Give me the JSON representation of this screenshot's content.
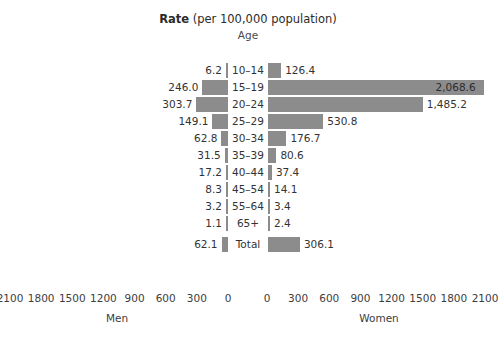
{
  "chart_data": {
    "type": "bar",
    "title": "Rate (per 100,000 population)",
    "title_strong": "Rate",
    "title_normal": " (per 100,000 population)",
    "category_header": "Age",
    "xlabel_left": "Men",
    "xlabel_right": "Women",
    "ylabel": "Age",
    "grid": false,
    "legend_position": "none",
    "axis_left_ticks": [
      2100,
      1800,
      1500,
      1200,
      900,
      600,
      300,
      0
    ],
    "axis_right_ticks": [
      0,
      300,
      600,
      900,
      1200,
      1500,
      1800,
      2100
    ],
    "axis_left_tick_labels": [
      "2100",
      "1800",
      "1500",
      "1200",
      "900",
      "600",
      "300",
      "0"
    ],
    "axis_right_tick_labels": [
      "0",
      "300",
      "600",
      "900",
      "1200",
      "1500",
      "1800",
      "2100"
    ],
    "xlim": [
      0,
      2100
    ],
    "bar_color": "#8c8c8c",
    "categories": [
      "10–14",
      "15–19",
      "20–24",
      "25–29",
      "30–34",
      "35–39",
      "40–44",
      "45–54",
      "55–64",
      "65+",
      "Total"
    ],
    "series": [
      {
        "name": "Men",
        "side": "left",
        "values": [
          6.2,
          246.0,
          303.7,
          149.1,
          62.8,
          31.5,
          17.2,
          8.3,
          3.2,
          1.1,
          62.1
        ],
        "labels": [
          "6.2",
          "246.0",
          "303.7",
          "149.1",
          "62.8",
          "31.5",
          "17.2",
          "8.3",
          "3.2",
          "1.1",
          "62.1"
        ]
      },
      {
        "name": "Women",
        "side": "right",
        "values": [
          126.4,
          2068.6,
          1485.2,
          530.8,
          176.7,
          80.6,
          37.4,
          14.1,
          3.4,
          2.4,
          306.1
        ],
        "labels": [
          "126.4",
          "2,068.6",
          "1,485.2",
          "530.8",
          "176.7",
          "80.6",
          "37.4",
          "14.1",
          "3.4",
          "2.4",
          "306.1"
        ]
      }
    ],
    "rows": [
      {
        "age": "10–14",
        "men": 6.2,
        "men_label": "6.2",
        "women": 126.4,
        "women_label": "126.4"
      },
      {
        "age": "15–19",
        "men": 246.0,
        "men_label": "246.0",
        "women": 2068.6,
        "women_label": "2,068.6"
      },
      {
        "age": "20–24",
        "men": 303.7,
        "men_label": "303.7",
        "women": 1485.2,
        "women_label": "1,485.2"
      },
      {
        "age": "25–29",
        "men": 149.1,
        "men_label": "149.1",
        "women": 530.8,
        "women_label": "530.8"
      },
      {
        "age": "30–34",
        "men": 62.8,
        "men_label": "62.8",
        "women": 176.7,
        "women_label": "176.7"
      },
      {
        "age": "35–39",
        "men": 31.5,
        "men_label": "31.5",
        "women": 80.6,
        "women_label": "80.6"
      },
      {
        "age": "40–44",
        "men": 17.2,
        "men_label": "17.2",
        "women": 37.4,
        "women_label": "37.4"
      },
      {
        "age": "45–54",
        "men": 8.3,
        "men_label": "8.3",
        "women": 14.1,
        "women_label": "14.1"
      },
      {
        "age": "55–64",
        "men": 3.2,
        "men_label": "3.2",
        "women": 3.4,
        "women_label": "3.4"
      },
      {
        "age": "65+",
        "men": 1.1,
        "men_label": "1.1",
        "women": 2.4,
        "women_label": "2.4"
      },
      {
        "age": "Total",
        "men": 62.1,
        "men_label": "62.1",
        "women": 306.1,
        "women_label": "306.1"
      }
    ]
  }
}
